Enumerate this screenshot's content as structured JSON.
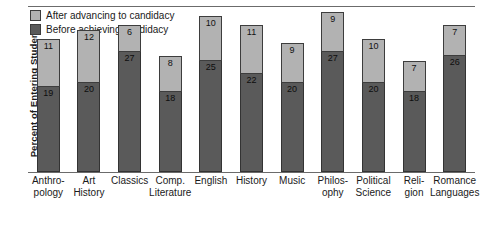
{
  "chart_data": {
    "type": "bar",
    "subtype": "stacked-vertical",
    "title": "",
    "xlabel": "",
    "ylabel": "Percent of Entering Students",
    "ylim": [
      0,
      36
    ],
    "grid": false,
    "legend_position": "top-left",
    "categories": [
      "Anthro-\npology",
      "Art\nHistory",
      "Classics",
      "Comp.\nLiterature",
      "English",
      "History",
      "Music",
      "Philos-\nophy",
      "Political\nScience",
      "Reli-\ngion",
      "Romance\nLanguages"
    ],
    "series": [
      {
        "name": "Before achieving candidacy",
        "color": "#5a5a5a",
        "values": [
          19,
          20,
          27,
          18,
          25,
          22,
          20,
          27,
          20,
          18,
          26
        ]
      },
      {
        "name": "After advancing to candidacy",
        "color": "#b2b2b2",
        "values": [
          11,
          12,
          6,
          8,
          10,
          11,
          9,
          9,
          10,
          7,
          7
        ]
      }
    ],
    "totals": [
      30,
      32,
      33,
      26,
      35,
      33,
      29,
      36,
      30,
      25,
      33
    ]
  },
  "legend": {
    "items": [
      {
        "label": "After advancing to candidacy",
        "swatch": "#b2b2b2"
      },
      {
        "label": "Before achieving candidacy",
        "swatch": "#5a5a5a"
      }
    ]
  },
  "axis": {
    "y_title": "Percent of Entering Students"
  }
}
